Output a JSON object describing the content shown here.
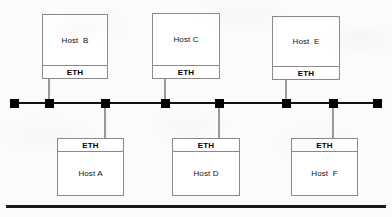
{
  "diagram": {
    "bus_label": "",
    "colors": {
      "background": "#fbfbfa",
      "bus_line": "#111111",
      "tap_marker": "#000000",
      "box_border": "#8a8a8a",
      "box_fill": "#ffffff",
      "stem_line": "#9a9a9a",
      "base_rule": "#1a1a1a",
      "text": "#111111"
    },
    "bus": {
      "x": 14,
      "y": 102,
      "width": 364,
      "thickness": 2
    },
    "base_rule": {
      "x": 6,
      "y": 205,
      "width": 380,
      "thickness": 3
    },
    "taps": [
      {
        "name": "tap-1",
        "x": 14
      },
      {
        "name": "tap-2",
        "x": 49
      },
      {
        "name": "tap-3",
        "x": 105
      },
      {
        "name": "tap-4",
        "x": 165
      },
      {
        "name": "tap-5",
        "x": 219
      },
      {
        "name": "tap-6",
        "x": 286
      },
      {
        "name": "tap-7",
        "x": 333
      },
      {
        "name": "tap-8",
        "x": 377
      }
    ],
    "interface_label": "ETH",
    "hosts": [
      {
        "id": "host-b",
        "name": "Host  B",
        "interface": "ETH",
        "position": "top",
        "x": 42,
        "y": 14,
        "width": 66,
        "height": 65,
        "stem_x": 49,
        "stem_y": 79,
        "stem_height": 24
      },
      {
        "id": "host-c",
        "name": "Host C",
        "interface": "ETH",
        "position": "top",
        "x": 152,
        "y": 13,
        "width": 68,
        "height": 66,
        "stem_x": 165,
        "stem_y": 79,
        "stem_height": 24
      },
      {
        "id": "host-e",
        "name": "Host  E",
        "interface": "ETH",
        "position": "top",
        "x": 272,
        "y": 16,
        "width": 68,
        "height": 64,
        "stem_x": 286,
        "stem_y": 80,
        "stem_height": 23
      },
      {
        "id": "host-a",
        "name": "Host A",
        "interface": "ETH",
        "position": "bottom",
        "x": 57,
        "y": 138,
        "width": 67,
        "height": 58,
        "stem_x": 105,
        "stem_y": 103,
        "stem_height": 35
      },
      {
        "id": "host-d",
        "name": "Host D",
        "interface": "ETH",
        "position": "bottom",
        "x": 172,
        "y": 138,
        "width": 68,
        "height": 58,
        "stem_x": 219,
        "stem_y": 103,
        "stem_height": 35
      },
      {
        "id": "host-f",
        "name": "Host  F",
        "interface": "ETH",
        "position": "bottom",
        "x": 291,
        "y": 138,
        "width": 67,
        "height": 58,
        "stem_x": 333,
        "stem_y": 103,
        "stem_height": 35
      }
    ]
  }
}
